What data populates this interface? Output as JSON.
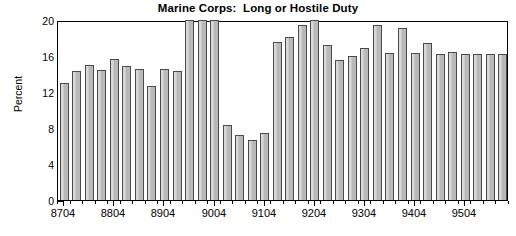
{
  "chart_data": {
    "type": "bar",
    "title": "Marine Corps:  Long or Hostile Duty",
    "xlabel": "",
    "ylabel": "Percent",
    "ylim": [
      0,
      20
    ],
    "yticks": [
      0,
      4,
      8,
      12,
      16,
      20
    ],
    "ytick_labels": [
      "0",
      "4",
      "8",
      "12",
      "16",
      "20"
    ],
    "grid": false,
    "legend": null,
    "categories": [
      "8704",
      "8707",
      "8710",
      "8801",
      "8804",
      "8807",
      "8810",
      "8901",
      "8904",
      "8907",
      "8910",
      "9001",
      "9004",
      "9007",
      "9010",
      "9101",
      "9104",
      "9107",
      "9110",
      "9201",
      "9204",
      "9207",
      "9210",
      "9301",
      "9304",
      "9307",
      "9310",
      "9401",
      "9404",
      "9407",
      "9410",
      "9501",
      "9504",
      "9507",
      "9510",
      "9601"
    ],
    "values": [
      13.0,
      14.3,
      15.0,
      14.4,
      15.7,
      14.9,
      14.6,
      12.7,
      14.6,
      14.3,
      20.4,
      20.6,
      20.4,
      8.3,
      7.2,
      6.7,
      7.4,
      17.6,
      18.1,
      19.5,
      20.2,
      17.2,
      15.6,
      16.0,
      16.9,
      19.5,
      16.3,
      19.1,
      16.3,
      17.5,
      16.2,
      16.4,
      16.2,
      16.2,
      16.2,
      16.2
    ],
    "xtick_labels": [
      "8704",
      "8804",
      "8904",
      "9004",
      "9104",
      "9204",
      "9304",
      "9404",
      "9504"
    ],
    "colors": {
      "bar_fill": "#b9b9b9",
      "bar_edge": "#4a4a4a",
      "axis": "#000000",
      "background": "#ffffff",
      "text": "#000000"
    }
  }
}
